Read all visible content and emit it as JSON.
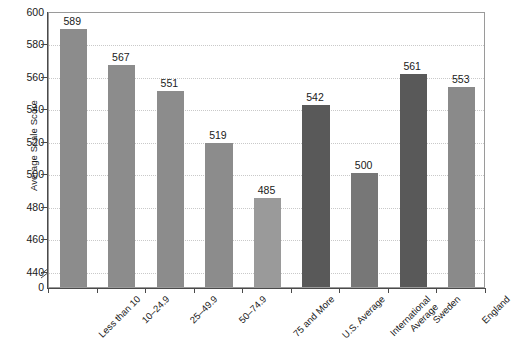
{
  "chart_data": {
    "type": "bar",
    "title": "",
    "subtitle": "",
    "xlabel": "",
    "ylabel": "Average Scale Score",
    "categories": [
      "Less than 10",
      "10–24.9",
      "25–49.9",
      "50–74.9",
      "75 and More",
      "U.S. Average",
      "International Average",
      "Sweden",
      "England"
    ],
    "category_lines": [
      [
        "Less than 10"
      ],
      [
        "10–24.9"
      ],
      [
        "25–49.9"
      ],
      [
        "50–74.9"
      ],
      [
        "75 and More"
      ],
      [
        "U.S. Average"
      ],
      [
        "International",
        "Average"
      ],
      [
        "Sweden"
      ],
      [
        "England"
      ]
    ],
    "values": [
      589,
      567,
      551,
      519,
      485,
      542,
      500,
      561,
      553
    ],
    "bar_colors": [
      "#8c8c8c",
      "#8c8c8c",
      "#8c8c8c",
      "#8c8c8c",
      "#9a9a9a",
      "#595959",
      "#777777",
      "#595959",
      "#8a8a8a"
    ],
    "ylim": [
      430,
      600
    ],
    "yticks": [
      440,
      460,
      480,
      500,
      520,
      540,
      560,
      580,
      600
    ],
    "ytick_labels": [
      "440",
      "460",
      "480",
      "500",
      "520",
      "540",
      "560",
      "580",
      "600"
    ],
    "zero_tick_label": "0",
    "axis_break": true,
    "grid": true,
    "grid_style": "dotted",
    "legend": "none"
  },
  "caption": {
    "text": ""
  },
  "colors": {
    "grid": "#c9c9c9",
    "axis": "#4a4a4a",
    "frame": "#9a9a9a",
    "text": "#1a1a1a",
    "background": "#ffffff"
  }
}
